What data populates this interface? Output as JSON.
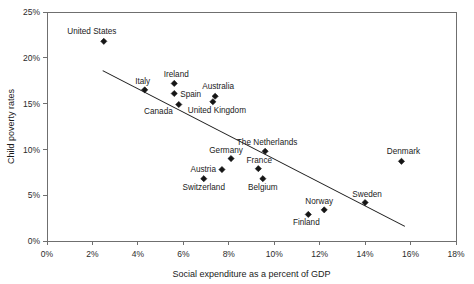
{
  "chart_data": {
    "type": "scatter",
    "title": "",
    "xlabel": "Social expenditure as a percent of GDP",
    "ylabel": "Child poverty rates",
    "xlim": [
      0,
      18
    ],
    "ylim": [
      0,
      25
    ],
    "xticks": [
      "0%",
      "2%",
      "4%",
      "6%",
      "8%",
      "10%",
      "12%",
      "14%",
      "16%",
      "18%"
    ],
    "xtick_values": [
      0,
      2,
      4,
      6,
      8,
      10,
      12,
      14,
      16,
      18
    ],
    "yticks": [
      "0%",
      "5%",
      "10%",
      "15%",
      "20%",
      "25%"
    ],
    "ytick_values": [
      0,
      5,
      10,
      15,
      20,
      25
    ],
    "grid": false,
    "legend": "none",
    "marker_color": "#151515",
    "line_color": "#1a1a1a",
    "axis_color": "#6f6f6f",
    "points": [
      {
        "label": "United States",
        "x": 2.5,
        "y": 21.8,
        "label_dx": -12,
        "label_dy": -7,
        "anchor": "middle"
      },
      {
        "label": "Italy",
        "x": 4.3,
        "y": 16.5,
        "label_dx": -2,
        "label_dy": -6,
        "anchor": "middle"
      },
      {
        "label": "Ireland",
        "x": 5.6,
        "y": 17.2,
        "label_dx": 2,
        "label_dy": -6,
        "anchor": "middle"
      },
      {
        "label": "Spain",
        "x": 5.6,
        "y": 16.1,
        "label_dx": 6,
        "label_dy": 3,
        "anchor": "start"
      },
      {
        "label": "Canada",
        "x": 5.8,
        "y": 14.9,
        "label_dx": -6,
        "label_dy": 9,
        "anchor": "end"
      },
      {
        "label": "Australia",
        "x": 7.4,
        "y": 15.8,
        "label_dx": 3,
        "label_dy": -7,
        "anchor": "middle"
      },
      {
        "label": "United Kingdom",
        "x": 7.3,
        "y": 15.2,
        "label_dx": 4,
        "label_dy": 11,
        "anchor": "middle"
      },
      {
        "label": "The Netherlands",
        "x": 9.6,
        "y": 9.8,
        "label_dx": 2,
        "label_dy": -6,
        "anchor": "middle"
      },
      {
        "label": "Germany",
        "x": 8.1,
        "y": 9.0,
        "label_dx": -5,
        "label_dy": -6,
        "anchor": "middle"
      },
      {
        "label": "France",
        "x": 9.3,
        "y": 7.9,
        "label_dx": 1,
        "label_dy": -6,
        "anchor": "middle"
      },
      {
        "label": "Austria",
        "x": 7.7,
        "y": 7.8,
        "label_dx": -6,
        "label_dy": 2,
        "anchor": "end"
      },
      {
        "label": "Switzerland",
        "x": 6.9,
        "y": 6.8,
        "label_dx": 0,
        "label_dy": 11,
        "anchor": "middle"
      },
      {
        "label": "Belgium",
        "x": 9.5,
        "y": 6.8,
        "label_dx": 0,
        "label_dy": 11,
        "anchor": "middle"
      },
      {
        "label": "Norway",
        "x": 12.2,
        "y": 3.4,
        "label_dx": -5,
        "label_dy": -6,
        "anchor": "middle"
      },
      {
        "label": "Finland",
        "x": 11.5,
        "y": 2.9,
        "label_dx": -2,
        "label_dy": 11,
        "anchor": "middle"
      },
      {
        "label": "Sweden",
        "x": 14.0,
        "y": 4.2,
        "label_dx": 2,
        "label_dy": -6,
        "anchor": "middle"
      },
      {
        "label": "Denmark",
        "x": 15.6,
        "y": 8.7,
        "label_dx": 2,
        "label_dy": -7,
        "anchor": "middle"
      }
    ],
    "trendline": {
      "x0": 2.45,
      "y0": 18.6,
      "x1": 15.75,
      "y1": 1.6
    }
  }
}
